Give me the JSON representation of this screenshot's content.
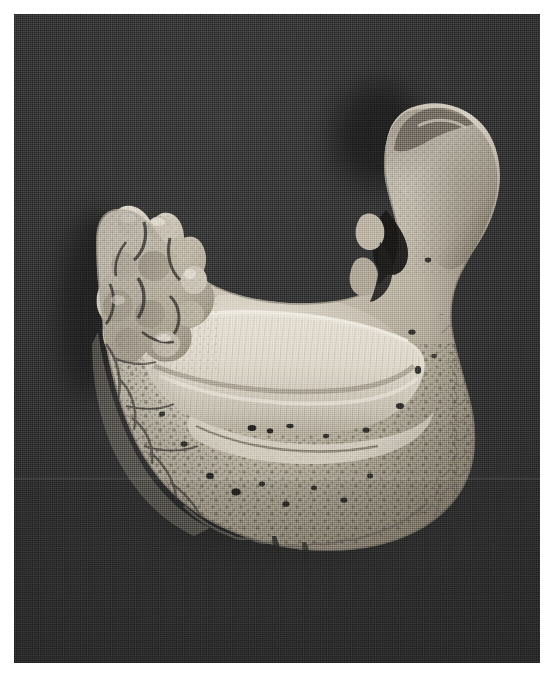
{
  "plate": {
    "width": 555,
    "height": 682,
    "page_background": "#ffffff",
    "caption": ""
  },
  "photo": {
    "x": 14,
    "y": 14,
    "width": 526,
    "height": 649,
    "medium": "halftone black-and-white photographic print",
    "backdrop_color": "#3c3c3c",
    "backdrop_highlight_color": "#464646",
    "backdrop_shadow_color": "#313131",
    "has_halftone_screen": true,
    "scan_seam_y": 478,
    "alt_text": "Black and white photograph of a dry human mandible specimen, edentulous and pathologically remodelled, photographed from a superior oblique angle against a dark gray cloth backdrop."
  },
  "specimen": {
    "name": "human-mandible",
    "common_label": "mandible (lower jaw)",
    "view": "superior oblique",
    "condition": "edentulous, resorbed, irregular periosteal new bone",
    "bone_base_color": "#ccc7bc",
    "bone_highlight_color": "#f2eee6",
    "bone_midtone_color": "#b3ada1",
    "bone_shadow_color": "#6d685e",
    "foramen_color": "#1d1b18",
    "shadow_color": "#242424",
    "bounding_box": {
      "x": 75,
      "y": 95,
      "width": 415,
      "height": 435
    },
    "regions": [
      {
        "id": "right-ramus-condyle",
        "label": "right ascending ramus and condyle",
        "note": "tall hook-shaped process rising to the upper right, thickened and pitted",
        "bbox": {
          "x": 352,
          "y": 95,
          "width": 138,
          "height": 230
        }
      },
      {
        "id": "right-body",
        "label": "right mandibular body",
        "note": "descends from the ramus with coarse porous cortex",
        "bbox": {
          "x": 330,
          "y": 280,
          "width": 160,
          "height": 200
        }
      },
      {
        "id": "alveolar-arch",
        "label": "resorbed alveolar ridge",
        "note": "smooth bright crescent forming the upper rim of the arch, finely striated",
        "bbox": {
          "x": 120,
          "y": 300,
          "width": 300,
          "height": 110
        }
      },
      {
        "id": "symphysis",
        "label": "symphysis / chin region",
        "note": "lowest part of the arch, densely pitted with foramina",
        "bbox": {
          "x": 170,
          "y": 395,
          "width": 230,
          "height": 135
        }
      },
      {
        "id": "left-ramus-stump",
        "label": "left ramus stump",
        "note": "short knobby irregular outgrowth at the upper left of the arch",
        "bbox": {
          "x": 82,
          "y": 195,
          "width": 120,
          "height": 190
        }
      },
      {
        "id": "left-body",
        "label": "left mandibular body",
        "note": "rough reticulated lateral surface",
        "bbox": {
          "x": 80,
          "y": 350,
          "width": 150,
          "height": 170
        }
      }
    ]
  },
  "icons": {
    "specimen": "bone-icon"
  }
}
